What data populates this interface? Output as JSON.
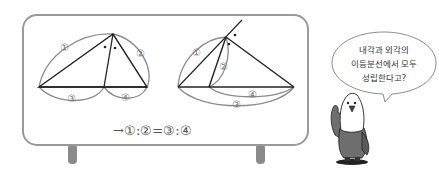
{
  "diagram": {
    "left_figure": {
      "name": "interior-angle-bisector",
      "labels": {
        "side_1": "①",
        "side_2": "②",
        "seg_3": "③",
        "seg_4": "④"
      },
      "angle_marks": [
        "•",
        "•"
      ]
    },
    "right_figure": {
      "name": "exterior-angle-bisector",
      "labels": {
        "side_1": "①",
        "side_2": "②",
        "seg_3": "③",
        "seg_4": "④"
      },
      "angle_marks": [
        "•",
        "•"
      ]
    },
    "formula": "→①:②=③:④"
  },
  "speech_bubble": {
    "lines": [
      "내각과 외각의",
      "이등분선에서 모두",
      "성립한다고?"
    ]
  },
  "colors": {
    "board_border": "#9a9a9a",
    "board_leg": "#8a8a8a",
    "line": "#222222",
    "arc": "#8c8c8c",
    "label": "#777777",
    "bird_body": "#6e6e6e"
  }
}
